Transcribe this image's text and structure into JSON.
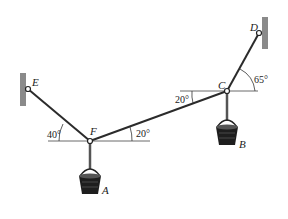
{
  "diagram": {
    "type": "statics-cable-system",
    "points": {
      "E": {
        "label": "E",
        "x": 28,
        "y": 89
      },
      "F": {
        "label": "F",
        "x": 90,
        "y": 141
      },
      "C": {
        "label": "C",
        "x": 227,
        "y": 91
      },
      "D": {
        "label": "D",
        "x": 259,
        "y": 33
      }
    },
    "loads": {
      "A": {
        "label": "A",
        "hangs_from": "F"
      },
      "B": {
        "label": "B",
        "hangs_from": "C"
      }
    },
    "angles": {
      "EF": "40°",
      "FC_at_F": "20°",
      "FC_at_C": "20°",
      "CD": "65°"
    },
    "colors": {
      "cable": "#2b2b2b",
      "wall": "#8a8a8a",
      "line": "#333333"
    }
  }
}
